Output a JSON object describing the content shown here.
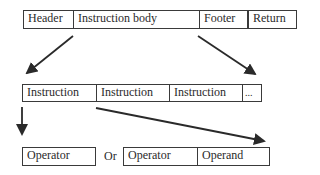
{
  "diagram": {
    "type": "hierarchical-structure",
    "levels": [
      {
        "name": "program",
        "cells": [
          {
            "label": "Header"
          },
          {
            "label": "Instruction body"
          },
          {
            "label": "Footer"
          },
          {
            "label": "Return"
          }
        ]
      },
      {
        "name": "instruction-body",
        "cells": [
          {
            "label": "Instruction"
          },
          {
            "label": "Instruction"
          },
          {
            "label": "Instruction"
          },
          {
            "label": "..."
          }
        ]
      },
      {
        "name": "instruction",
        "alt_single": {
          "cells": [
            {
              "label": "Operator"
            }
          ]
        },
        "separator": "Or",
        "alt_pair": {
          "cells": [
            {
              "label": "Operator"
            },
            {
              "label": "Operand"
            }
          ]
        }
      }
    ],
    "edges": [
      {
        "from": "Instruction body (left edge)",
        "to": "instruction-body row (left)"
      },
      {
        "from": "Instruction body (right edge)",
        "to": "instruction-body row (right end)"
      },
      {
        "from": "Instruction (left)",
        "to": "Operator (single form)"
      },
      {
        "from": "Instruction (right edge)",
        "to": "Operand (pair form, right end)"
      }
    ],
    "colors": {
      "stroke": "#3a3a3a",
      "background": "#ffffff",
      "text": "#2a2a2a"
    }
  }
}
